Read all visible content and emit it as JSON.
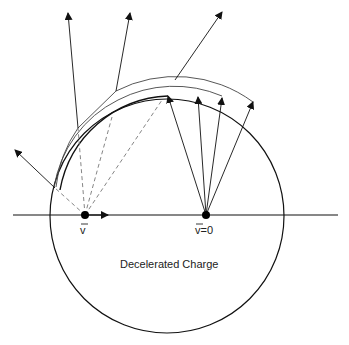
{
  "diagram": {
    "title": "Decelerated Charge",
    "labels": {
      "moving_charge": "v",
      "stopped_charge": "v=0",
      "caption": "Decelerated Charge"
    },
    "colors": {
      "line": "#111111",
      "shell": "#444444",
      "dashed": "#777777"
    }
  }
}
